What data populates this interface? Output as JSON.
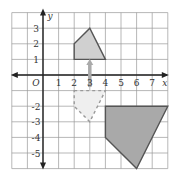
{
  "diagram": {
    "type": "coordinate-grid",
    "x_axis": {
      "label": "x",
      "range": [
        -2,
        8
      ],
      "tick_labels": [
        "1",
        "2",
        "3",
        "4",
        "5",
        "6",
        "7"
      ]
    },
    "y_axis": {
      "label": "y",
      "range": [
        -6,
        4
      ],
      "tick_labels": [
        "3",
        "2",
        "1",
        "-2",
        "-3",
        "-4",
        "-5"
      ]
    },
    "origin_label": "O",
    "shapes": [
      {
        "name": "small-shape",
        "style": "filled",
        "fill": "#d0d0d0",
        "stroke": "#555555",
        "vertices": [
          [
            2,
            1
          ],
          [
            2,
            2
          ],
          [
            3,
            3
          ],
          [
            4,
            1
          ]
        ]
      },
      {
        "name": "reflected-shape",
        "style": "dashed",
        "fill": "#efefef",
        "stroke": "#999999",
        "vertices": [
          [
            2,
            -1
          ],
          [
            4,
            -1
          ],
          [
            3,
            -3
          ],
          [
            2,
            -2
          ]
        ]
      },
      {
        "name": "large-shape",
        "style": "filled",
        "fill": "#a9a9a9",
        "stroke": "#555555",
        "vertices": [
          [
            4,
            -2
          ],
          [
            8,
            -2
          ],
          [
            6,
            -6
          ],
          [
            4,
            -4
          ]
        ]
      }
    ],
    "arrow": {
      "name": "reflection-arrow",
      "x": 3,
      "from_y": -0.9,
      "to_y": 0.9,
      "color": "#aaaaaa"
    },
    "colors": {
      "grid": "#9a9a9a",
      "axis": "#222222"
    }
  }
}
